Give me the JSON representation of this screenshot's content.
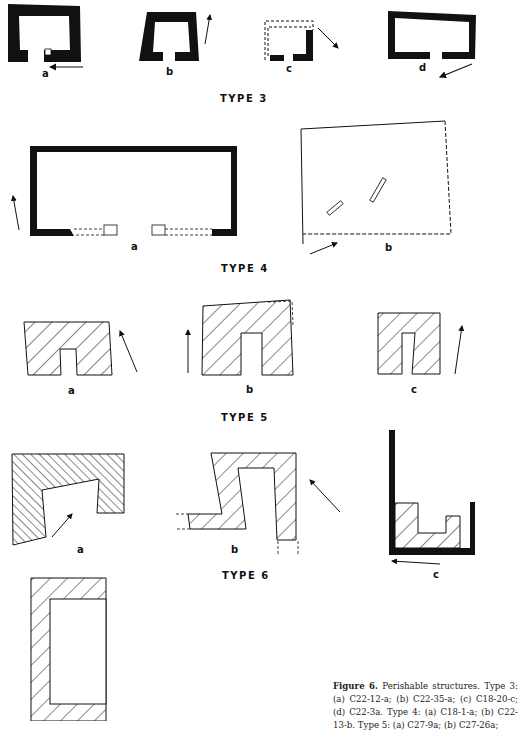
{
  "figure": {
    "number_label": "Figure 6.",
    "caption_text": " Perishable structures. Type 3: (a) C22-12-a; (b) C22-35-a; (c) C18-20-c; (d) C22-3a. Type 4: (a) C18-1-a; (b) C22-13-b. Type 5: (a) C27-9a; (b) C27-26a;"
  },
  "types": [
    {
      "label": "TYPE 3",
      "items": [
        {
          "letter": "a",
          "site": "C22-12-a"
        },
        {
          "letter": "b",
          "site": "C22-35-a"
        },
        {
          "letter": "c",
          "site": "C18-20-c"
        },
        {
          "letter": "d",
          "site": "C22-3a"
        }
      ]
    },
    {
      "label": "TYPE 4",
      "items": [
        {
          "letter": "a",
          "site": "C18-1-a"
        },
        {
          "letter": "b",
          "site": "C22-13-b"
        }
      ]
    },
    {
      "label": "TYPE 5",
      "items": [
        {
          "letter": "a",
          "site": "C27-9a"
        },
        {
          "letter": "b",
          "site": "C27-26a"
        },
        {
          "letter": "c"
        }
      ]
    },
    {
      "label": "TYPE 6",
      "items": [
        {
          "letter": "a"
        },
        {
          "letter": "b"
        },
        {
          "letter": "c"
        }
      ]
    }
  ],
  "colors": {
    "ink": "#111111",
    "paper": "#ffffff"
  }
}
